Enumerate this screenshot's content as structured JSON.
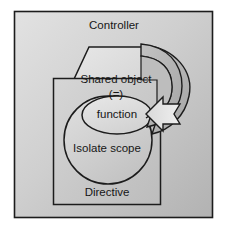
{
  "diagram": {
    "title_text": "Controller",
    "shapes": {
      "outer_box": {
        "name": "Controller",
        "label": "Controller",
        "shape": "rectangle",
        "fill": "#c9c9c9",
        "stroke": "#1c1c1c"
      },
      "hexagon": {
        "name": "Shared object",
        "label": "Shared object",
        "sublabel": "(=)",
        "shape": "hexagon",
        "fill": "#d8d8d8",
        "stroke": "#1c1c1c"
      },
      "inner_box": {
        "name": "Directive",
        "label": "Directive",
        "shape": "rectangle",
        "fill": "#c4c4c4",
        "stroke": "#1c1c1c"
      },
      "circle": {
        "name": "Isolate scope",
        "label": "Isolate scope",
        "shape": "circle",
        "fill": "#cbcbcb",
        "stroke": "#1c1c1c"
      },
      "ellipse": {
        "name": "function",
        "label": "function",
        "shape": "ellipse",
        "fill": "#dcdcdc",
        "stroke": "#1c1c1c"
      },
      "arrow": {
        "name": "binding-arrow",
        "shape": "curved-ribbon-arrow",
        "fill": "#b4b4b4",
        "stroke": "#1c1c1c",
        "direction": "from shared object down and back into function"
      }
    }
  }
}
